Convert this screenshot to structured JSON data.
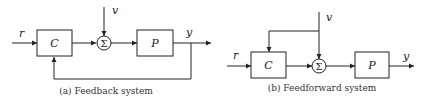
{
  "diagrams": [
    {
      "id": "a",
      "caption": "(a) Feedback system",
      "blocks": {
        "controller": "C",
        "plant": "P",
        "summer": "Σ"
      },
      "signals": {
        "reference": "r",
        "disturbance": "v",
        "output": "y"
      }
    },
    {
      "id": "b",
      "caption": "(b) Feedforward system",
      "blocks": {
        "controller": "C",
        "plant": "P",
        "summer": "Σ"
      },
      "signals": {
        "reference": "r",
        "disturbance": "v",
        "output": "y"
      }
    }
  ]
}
